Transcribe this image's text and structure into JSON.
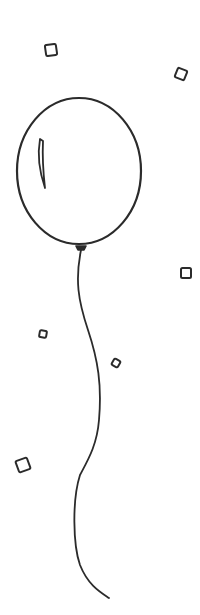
{
  "illustration": {
    "subject": "balloon with confetti",
    "stroke_color": "#2b2b2b",
    "background_color": "#ffffff",
    "balloon": {
      "cx": 79,
      "cy": 171,
      "rx": 62,
      "ry": 73
    },
    "confetti": [
      {
        "x": 51,
        "y": 50,
        "size": 11,
        "rotate": -8
      },
      {
        "x": 181,
        "y": 74,
        "size": 10,
        "rotate": 22
      },
      {
        "x": 186,
        "y": 273,
        "size": 10,
        "rotate": 0
      },
      {
        "x": 43,
        "y": 334,
        "size": 7,
        "rotate": 10
      },
      {
        "x": 116,
        "y": 363,
        "size": 7,
        "rotate": 30
      },
      {
        "x": 23,
        "y": 465,
        "size": 12,
        "rotate": -20
      }
    ]
  }
}
